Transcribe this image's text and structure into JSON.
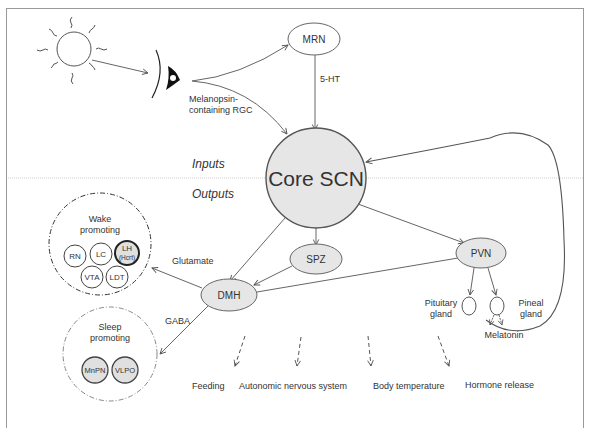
{
  "inputs_label": "Inputs",
  "outputs_label": "Outputs",
  "sun": {
    "icon": "sun-icon"
  },
  "eye": {
    "icon": "eye-icon",
    "label_line1": "Melanopsin-",
    "label_line2": "containing RGC"
  },
  "mrn": {
    "label": "MRN",
    "edge_label": "5-HT"
  },
  "core_scn": {
    "label": "Core SCN"
  },
  "spz": {
    "label": "SPZ"
  },
  "dmh": {
    "label": "DMH",
    "glutamate_label": "Glutamate",
    "gaba_label": "GABA"
  },
  "pvn": {
    "label": "PVN"
  },
  "pituitary": {
    "label_line1": "Pituitary",
    "label_line2": "gland"
  },
  "pineal": {
    "label_line1": "Pineal",
    "label_line2": "gland",
    "output_label": "Melatonin"
  },
  "wake_group": {
    "title_line1": "Wake",
    "title_line2": "promoting",
    "nodes": [
      {
        "label": "RN"
      },
      {
        "label": "LC"
      },
      {
        "label": "LH",
        "sublabel": "(Hcrt)"
      },
      {
        "label": "VTA"
      },
      {
        "label": "LDT"
      }
    ]
  },
  "sleep_group": {
    "title_line1": "Sleep",
    "title_line2": "promoting",
    "nodes": [
      {
        "label": "MnPN"
      },
      {
        "label": "VLPO"
      }
    ]
  },
  "outputs": [
    {
      "label": "Feeding"
    },
    {
      "label": "Autonomic nervous system"
    },
    {
      "label": "Body temperature"
    },
    {
      "label": "Hormone release"
    }
  ]
}
